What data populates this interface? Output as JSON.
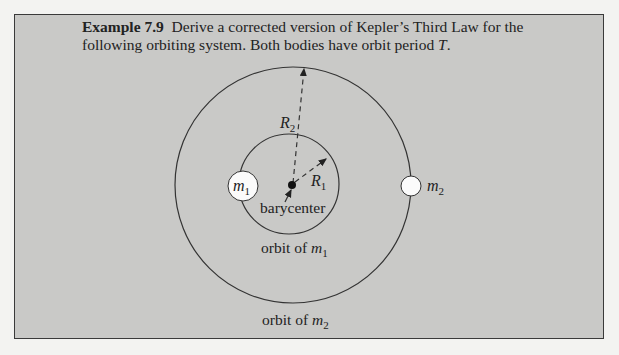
{
  "example": {
    "number_label": "Example 7.9",
    "text": "Derive a corrected version of Kepler’s Third Law for the following orbiting system. Both bodies have orbit period ",
    "period_symbol": "T",
    "end": "."
  },
  "diagram": {
    "labels": {
      "R2": "R",
      "R2_sub": "2",
      "R1": "R",
      "R1_sub": "1",
      "m1": "m",
      "m1_sub": "1",
      "m2": "m",
      "m2_sub": "2",
      "barycenter": "barycenter",
      "orbit_m1_prefix": "orbit of ",
      "orbit_m1_var": "m",
      "orbit_m1_sub": "1",
      "orbit_m2_prefix": "orbit of ",
      "orbit_m2_var": "m",
      "orbit_m2_sub": "2"
    }
  }
}
